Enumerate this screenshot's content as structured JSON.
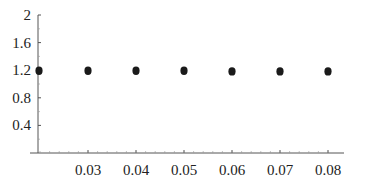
{
  "chart_data": {
    "type": "scatter",
    "title": "",
    "xlabel": "",
    "ylabel": "",
    "x": [
      0.02,
      0.03,
      0.04,
      0.05,
      0.06,
      0.07,
      0.08
    ],
    "y": [
      1.2,
      1.2,
      1.2,
      1.2,
      1.19,
      1.19,
      1.19
    ],
    "series": [
      {
        "name": "",
        "x": [
          0.02,
          0.03,
          0.04,
          0.05,
          0.06,
          0.07,
          0.08
        ],
        "values": [
          1.2,
          1.2,
          1.2,
          1.2,
          1.19,
          1.19,
          1.19
        ]
      }
    ],
    "xlim": [
      0.0165,
      0.0815
    ],
    "ylim": [
      0,
      2
    ],
    "xticks": [
      "0.03",
      "0.04",
      "0.05",
      "0.06",
      "0.07",
      "0.08"
    ],
    "yticks": [
      "0.4",
      "0.8",
      "1.2",
      "1.6",
      "2"
    ],
    "grid": false,
    "legend": "none",
    "marker_color": "#1a1a1a",
    "axis_color": "#555555"
  }
}
